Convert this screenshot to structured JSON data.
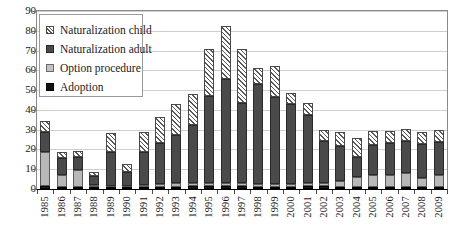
{
  "chart_data": {
    "type": "bar",
    "subtype": "stacked",
    "title": "",
    "xlabel": "",
    "ylabel": "",
    "ylim": [
      0,
      90
    ],
    "ytick_interval": 10,
    "yticks": [
      0,
      10,
      20,
      30,
      40,
      50,
      60,
      70,
      80,
      90
    ],
    "ytick_labels": [
      "0",
      "10",
      "20",
      "30",
      "40",
      "50",
      "60",
      "70",
      "80",
      "90"
    ],
    "grid": true,
    "grid_axis": "y",
    "legend_position": "upper-left-inside",
    "categories": [
      "1985",
      "1986",
      "1987",
      "1988",
      "1989",
      "1990",
      "1991",
      "1992",
      "1993",
      "1994",
      "1995",
      "1996",
      "1997",
      "1998",
      "1999",
      "2000",
      "2001",
      "2002",
      "2003",
      "2004",
      "2005",
      "2006",
      "2007",
      "2008",
      "2009"
    ],
    "series": [
      {
        "name": "Adoption",
        "color": "#1c1c1c",
        "pattern": "solid-black",
        "values": [
          1.5,
          1.0,
          1.0,
          0.8,
          0.8,
          0.8,
          1.2,
          1.2,
          1.2,
          1.5,
          1.5,
          1.5,
          1.5,
          1.2,
          1.2,
          1.2,
          1.5,
          1.5,
          1.2,
          1.2,
          1.2,
          1.2,
          1.2,
          1.2,
          1.2
        ]
      },
      {
        "name": "Option procedure",
        "color": "#b8b8b8",
        "pattern": "solid-light-gray",
        "values": [
          17.0,
          6.0,
          8.5,
          1.2,
          0.5,
          0.5,
          0.8,
          1.5,
          2.0,
          1.5,
          1.5,
          1.5,
          1.5,
          1.5,
          1.5,
          1.5,
          1.5,
          1.5,
          3.0,
          5.0,
          6.0,
          6.0,
          7.0,
          4.5,
          6.0
        ]
      },
      {
        "name": "Naturalization adult",
        "color": "#4a4a4a",
        "pattern": "solid-dark-gray",
        "values": [
          10.5,
          8.5,
          6.5,
          4.8,
          17.5,
          7.5,
          16.5,
          20.5,
          24.0,
          29.5,
          44.0,
          52.5,
          40.5,
          50.5,
          44.0,
          40.5,
          34.5,
          21.5,
          17.5,
          10.0,
          15.0,
          16.0,
          16.0,
          17.0,
          16.5
        ]
      },
      {
        "name": "Naturalization child",
        "color": "hatched",
        "pattern": "diagonal-hatch",
        "values": [
          5.5,
          3.0,
          3.0,
          2.0,
          9.5,
          4.0,
          10.5,
          13.0,
          16.0,
          15.5,
          24.0,
          27.0,
          27.5,
          8.0,
          15.5,
          5.5,
          6.0,
          5.5,
          7.0,
          9.5,
          7.0,
          6.0,
          6.0,
          6.0,
          6.0
        ]
      }
    ],
    "totals": [
      34.5,
      18.5,
      19.0,
      8.8,
      28.3,
      12.8,
      29.0,
      36.2,
      43.2,
      48.0,
      71.0,
      82.5,
      71.0,
      61.2,
      62.2,
      48.7,
      43.5,
      30.0,
      28.7,
      25.7,
      29.2,
      29.2,
      30.2,
      28.7,
      29.7
    ]
  },
  "legend": {
    "items": [
      {
        "label": "Naturalization child",
        "swatch": "hatch-swatch"
      },
      {
        "label": "Naturalization adult",
        "swatch": "dark-gray-swatch"
      },
      {
        "label": "Option procedure",
        "swatch": "light-gray-swatch"
      },
      {
        "label": "Adoption",
        "swatch": "black-swatch"
      }
    ]
  }
}
